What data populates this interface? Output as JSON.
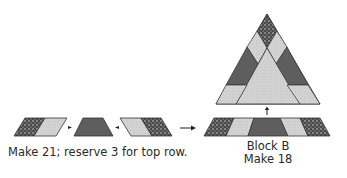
{
  "units": {
    "unit_piece": {
      "caption": "Make 21; reserve 3 for top row.",
      "pieces": [
        "dark-print-parallelogram-left",
        "light-parallelogram-left",
        "medium-trapezoid",
        "light-parallelogram-right",
        "dark-print-parallelogram-right"
      ]
    },
    "block": {
      "title": "Block B",
      "caption": "Make 18"
    }
  },
  "colors": {
    "dark_print": "#4a4a4a",
    "dark_print_dots": "#d0d0d0",
    "medium": "#5e5e5e",
    "light": "#cfcfcf",
    "outline": "#333333",
    "arrow": "#222222"
  }
}
